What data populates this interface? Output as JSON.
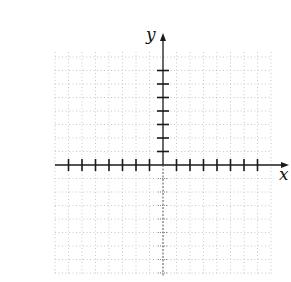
{
  "figure": {
    "type": "coordinate-plane",
    "x_axis_label": "x",
    "y_axis_label": "y",
    "colors": {
      "axis": "#1a1a1a",
      "grid": "#c8c8c8",
      "background": "#ffffff"
    },
    "origin_px": [
      163,
      165
    ],
    "tick_spacing_px": 13.5,
    "x_ticks_left": 7,
    "x_ticks_right": 7,
    "y_ticks_up": 7,
    "y_ticks_down": 8,
    "grid_bounds_px": {
      "left": 55,
      "right": 272,
      "top": 52,
      "bottom": 276
    }
  }
}
